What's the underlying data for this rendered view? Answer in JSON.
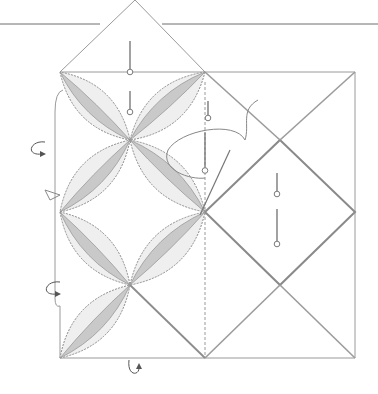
{
  "figure": {
    "colors": {
      "background": "#ffffff",
      "line": "#9a9a9a",
      "petal_fill": "#c9c9c9",
      "petal_dark": "#a8a8a8",
      "pin": "#7a7a7a"
    },
    "rules": [
      {
        "x1": 0,
        "y1": 24,
        "x2": 100,
        "y2": 24
      },
      {
        "x1": 162,
        "y1": 24,
        "x2": 378,
        "y2": 24
      }
    ],
    "top_diamond": [
      [
        135,
        0
      ],
      [
        205,
        72
      ],
      [
        130,
        72
      ],
      [
        60,
        72
      ]
    ],
    "left_square": {
      "x": 55,
      "y": 72,
      "w": 150,
      "h": 286
    },
    "right_square": {
      "x": 205,
      "y": 72,
      "w": 150,
      "h": 286
    },
    "right_diamond": [
      [
        280,
        140
      ],
      [
        355,
        212
      ],
      [
        280,
        285
      ],
      [
        205,
        212
      ]
    ],
    "petals": [
      {
        "a": [
          60,
          72
        ],
        "b": [
          130,
          140
        ]
      },
      {
        "a": [
          205,
          72
        ],
        "b": [
          130,
          140
        ]
      },
      {
        "a": [
          60,
          212
        ],
        "b": [
          130,
          140
        ]
      },
      {
        "a": [
          205,
          212
        ],
        "b": [
          130,
          140
        ]
      },
      {
        "a": [
          60,
          212
        ],
        "b": [
          130,
          285
        ]
      },
      {
        "a": [
          205,
          212
        ],
        "b": [
          130,
          285
        ]
      },
      {
        "a": [
          60,
          358
        ],
        "b": [
          130,
          285
        ]
      }
    ],
    "pins": [
      {
        "x": 130,
        "y": 55,
        "len": 28
      },
      {
        "x": 130,
        "y": 100,
        "len": 18
      },
      {
        "x": 208,
        "y": 108,
        "len": 14
      },
      {
        "x": 205,
        "y": 150,
        "len": 35
      },
      {
        "x": 277,
        "y": 182,
        "len": 18
      },
      {
        "x": 277,
        "y": 225,
        "len": 32
      }
    ],
    "arrows": [
      {
        "x": 30,
        "y": 150
      },
      {
        "x": 45,
        "y": 290
      },
      {
        "x": 135,
        "y": 372
      }
    ]
  }
}
